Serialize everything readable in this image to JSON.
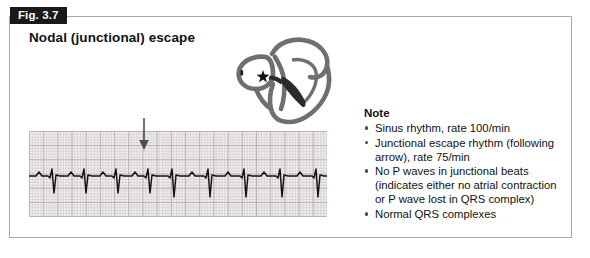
{
  "figure": {
    "tab_label": "Fig. 3.7",
    "title": "Nodal (junctional) escape"
  },
  "heart_diagram": {
    "icon_name": "heart-cross-section-diagram",
    "av_node_marker": "star-icon",
    "conduction_marker": "conduction-wedge-icon",
    "outline_color": "#6f6f6f",
    "fill_color": "#ffffff",
    "wedge_color": "#2b2b2b"
  },
  "ecg": {
    "marker_icon": "down-arrow-icon",
    "grid_color": "#d9d4d6",
    "grid_major_color": "#b9b2b4",
    "paper_color": "#f3f0f0",
    "trace_color": "#141414",
    "trace_path": "M0,45 L7,45 L10,41 L13,45 L19,45 L21,47 L23,38 L25,62 L27,44 L31,45 L39,45 L42,41 L45,45 L51,45 L53,47 L55,38 L57,62 L59,44 L63,45 L71,45 L74,41 L77,45 L83,45 L85,47 L87,38 L89,62 L91,44 L95,45 L103,45 L106,41 L109,45 L115,45 L117,47 L119,38 L121,62 L123,44 L127,45 L139,45 L141,47 L143,38 L145,66 L147,44 L151,45 L160,45 L163,41 L166,45 L175,45 L177,47 L179,38 L181,66 L183,44 L187,45 L196,45 L199,41 L202,45 L211,45 L213,47 L215,38 L217,66 L219,44 L223,45 L232,45 L235,41 L238,45 L247,45 L249,47 L251,38 L253,66 L255,44 L259,45 L268,45 L271,41 L274,45 L283,45 L285,47 L287,38 L289,66 L291,44 L295,45 L298,45"
  },
  "note": {
    "heading": "Note",
    "items": [
      "Sinus rhythm, rate 100/min",
      "Junctional escape rhythm (following arrow), rate 75/min",
      "No P waves in junctional beats (indicates either no atrial contraction or P wave lost in QRS complex)",
      "Normal QRS complexes"
    ]
  }
}
